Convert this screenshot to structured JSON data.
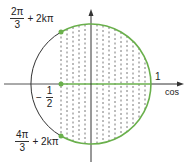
{
  "diagram": {
    "type": "unit-circle",
    "axis_label_x": "cos",
    "tick_label_one": "1",
    "cos_value": {
      "sign": "−",
      "numerator": "1",
      "denominator": "2"
    },
    "angle_upper": {
      "numerator": "2π",
      "denominator": "3",
      "suffix": "+ 2kπ"
    },
    "angle_lower": {
      "numerator": "4π",
      "denominator": "3",
      "suffix": "+ 2kπ"
    },
    "colors": {
      "highlight_arc": "#6ab04c",
      "circle": "#333333",
      "axis": "#333333",
      "hatch": "#555555"
    }
  }
}
